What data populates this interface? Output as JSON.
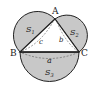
{
  "diagram": {
    "colors": {
      "fill": "#c8c8c8",
      "stroke": "#222222",
      "dash": "#555555"
    },
    "points": {
      "A": {
        "label": "A"
      },
      "B": {
        "label": "B"
      },
      "C": {
        "label": "C"
      }
    },
    "sides": {
      "a": "a",
      "b": "b",
      "c": "c"
    },
    "regions": {
      "s1": {
        "letter": "S",
        "sub": "1"
      },
      "s2": {
        "letter": "S",
        "sub": "2"
      },
      "s3": {
        "letter": "S",
        "sub": "3"
      }
    }
  }
}
